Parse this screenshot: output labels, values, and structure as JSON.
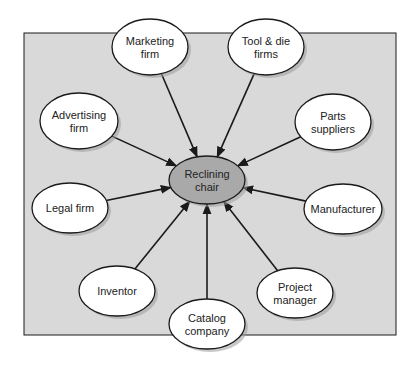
{
  "diagram": {
    "background_color": "#d9d9d9",
    "center_fill": "#a9a9a9",
    "node_fill": "#ffffff",
    "stroke_color": "#1a1a1a",
    "center": {
      "id": "reclining-chair",
      "lines": [
        "Reclining",
        "chair"
      ],
      "cx": 207,
      "cy": 180,
      "rx": 38,
      "ry": 24
    },
    "nodes": [
      {
        "id": "marketing-firm",
        "lines": [
          "Marketing",
          "firm"
        ],
        "cx": 150,
        "cy": 47,
        "rx": 38,
        "ry": 28
      },
      {
        "id": "tool-die-firms",
        "lines": [
          "Tool & die",
          "firms"
        ],
        "cx": 266,
        "cy": 47,
        "rx": 38,
        "ry": 28
      },
      {
        "id": "advertising-firm",
        "lines": [
          "Advertising",
          "firm"
        ],
        "cx": 79,
        "cy": 121,
        "rx": 39,
        "ry": 28
      },
      {
        "id": "parts-suppliers",
        "lines": [
          "Parts",
          "suppliers"
        ],
        "cx": 333,
        "cy": 122,
        "rx": 38,
        "ry": 28
      },
      {
        "id": "legal-firm",
        "lines": [
          "Legal firm"
        ],
        "cx": 70,
        "cy": 208,
        "rx": 38,
        "ry": 25
      },
      {
        "id": "manufacturer",
        "lines": [
          "Manufacturer"
        ],
        "cx": 343,
        "cy": 209,
        "rx": 39,
        "ry": 25
      },
      {
        "id": "inventor",
        "lines": [
          "Inventor"
        ],
        "cx": 117,
        "cy": 291,
        "rx": 38,
        "ry": 25
      },
      {
        "id": "project-manager",
        "lines": [
          "Project",
          "manager"
        ],
        "cx": 295,
        "cy": 293,
        "rx": 38,
        "ry": 25
      },
      {
        "id": "catalog-company",
        "lines": [
          "Catalog",
          "company"
        ],
        "cx": 207,
        "cy": 324,
        "rx": 38,
        "ry": 25
      }
    ],
    "frame": {
      "x": 24,
      "y": 33,
      "w": 372,
      "h": 302
    }
  }
}
